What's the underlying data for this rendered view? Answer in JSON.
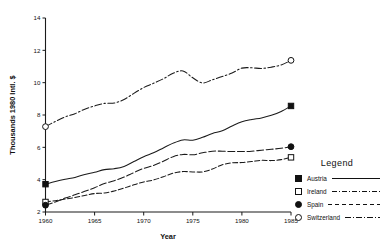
{
  "chart_data": {
    "type": "line",
    "title": "",
    "xlabel": "Year",
    "ylabel": "Thousands 1980 Intl. $",
    "xlim": [
      1960,
      1985
    ],
    "ylim": [
      2,
      14
    ],
    "grid": false,
    "legend_position": "right",
    "legend_title": "Legend",
    "xticks": [
      1960,
      1965,
      1970,
      1975,
      1980,
      1985
    ],
    "xtick_labels": [
      "1960",
      "1965",
      "1970",
      "1975",
      "1980",
      "1985"
    ],
    "yticks": [
      2,
      4,
      6,
      8,
      10,
      12,
      14
    ],
    "ytick_labels": [
      "2",
      "4",
      "6",
      "8",
      "10",
      "12",
      "14"
    ],
    "x": [
      1960,
      1961,
      1962,
      1963,
      1964,
      1965,
      1966,
      1967,
      1968,
      1969,
      1970,
      1971,
      1972,
      1973,
      1974,
      1975,
      1976,
      1977,
      1978,
      1979,
      1980,
      1981,
      1982,
      1983,
      1984,
      1985
    ],
    "series": [
      {
        "name": "Austria",
        "marker": "filled-square",
        "line_style": "solid",
        "values": [
          3.72,
          3.88,
          4.02,
          4.14,
          4.32,
          4.46,
          4.62,
          4.68,
          4.82,
          5.12,
          5.42,
          5.66,
          5.96,
          6.26,
          6.46,
          6.44,
          6.62,
          6.86,
          7.02,
          7.32,
          7.58,
          7.72,
          7.82,
          7.98,
          8.22,
          8.56
        ],
        "endpoints": {
          "start_year": 1960,
          "start_value": 3.72,
          "end_year": 1985,
          "end_value": 8.56
        }
      },
      {
        "name": "Ireland",
        "marker": "open-square",
        "line_style": "dashed",
        "values": [
          2.62,
          2.7,
          2.8,
          2.9,
          3.02,
          3.14,
          3.18,
          3.3,
          3.48,
          3.68,
          3.86,
          3.98,
          4.18,
          4.4,
          4.5,
          4.48,
          4.48,
          4.66,
          4.92,
          5.04,
          5.06,
          5.12,
          5.2,
          5.18,
          5.24,
          5.38
        ],
        "endpoints": {
          "start_year": 1960,
          "start_value": 2.62,
          "end_year": 1985,
          "end_value": 5.38
        }
      },
      {
        "name": "Spain",
        "marker": "filled-circle",
        "line_style": "dashed-long",
        "values": [
          2.42,
          2.62,
          2.86,
          3.06,
          3.28,
          3.5,
          3.76,
          3.94,
          4.16,
          4.44,
          4.7,
          4.88,
          5.14,
          5.42,
          5.56,
          5.54,
          5.66,
          5.76,
          5.76,
          5.74,
          5.74,
          5.76,
          5.82,
          5.88,
          5.94,
          6.04
        ],
        "endpoints": {
          "start_year": 1960,
          "start_value": 2.42,
          "end_year": 1985,
          "end_value": 6.04
        }
      },
      {
        "name": "Switzerland",
        "marker": "open-circle",
        "line_style": "dash-dot",
        "values": [
          7.28,
          7.6,
          7.88,
          8.08,
          8.36,
          8.56,
          8.72,
          8.74,
          8.96,
          9.34,
          9.7,
          9.96,
          10.24,
          10.58,
          10.72,
          10.3,
          9.98,
          10.18,
          10.38,
          10.6,
          10.9,
          10.92,
          10.88,
          10.96,
          11.1,
          11.38
        ],
        "endpoints": {
          "start_year": 1960,
          "start_value": 7.28,
          "end_year": 1985,
          "end_value": 11.38
        }
      }
    ]
  },
  "legend": {
    "title": "Legend",
    "items": [
      {
        "label": "Austria",
        "marker": "filled-square",
        "style": "solid"
      },
      {
        "label": "Ireland",
        "marker": "open-square",
        "style": "dashdotdot"
      },
      {
        "label": "Spain",
        "marker": "filled-circle",
        "style": "dashed"
      },
      {
        "label": "Switzerland",
        "marker": "open-circle",
        "style": "dashdot"
      }
    ]
  },
  "colors": {
    "ink": "#111111",
    "background": "#ffffff"
  }
}
